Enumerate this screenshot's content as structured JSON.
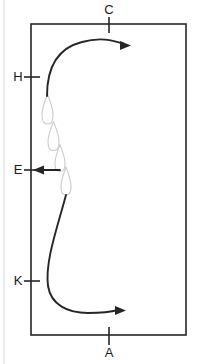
{
  "figure": {
    "title": "",
    "background_color": "#ffffff",
    "stroke_color": "#262626",
    "droplet_color": "#cccccc",
    "margin_rule_color": "#d8d8d8",
    "width": 197,
    "height": 364
  },
  "frame": {
    "name": "rectangle-border",
    "left": 31,
    "top": 24,
    "right": 186,
    "bottom": 335,
    "stroke_width": 1.6
  },
  "labels": {
    "top": {
      "text": "C",
      "x": 109,
      "y": 14,
      "tick_axis": "vertical"
    },
    "bottom": {
      "text": "A",
      "x": 109,
      "y": 357,
      "tick_axis": "vertical"
    },
    "left_upper": {
      "text": "H",
      "x": 18,
      "y": 81,
      "tick_axis": "horizontal"
    },
    "left_middle": {
      "text": "E",
      "x": 18,
      "y": 174,
      "tick_axis": "horizontal"
    },
    "left_lower": {
      "text": "K",
      "x": 18,
      "y": 285,
      "tick_axis": "horizontal"
    }
  },
  "ticks": [
    {
      "name": "tick-c",
      "x1": 109,
      "y1": 17,
      "x2": 109,
      "y2": 33
    },
    {
      "name": "tick-a",
      "x1": 109,
      "y1": 327,
      "x2": 109,
      "y2": 345
    },
    {
      "name": "tick-h",
      "x1": 24,
      "y1": 77,
      "x2": 40,
      "y2": 77
    },
    {
      "name": "tick-e",
      "x1": 24,
      "y1": 170,
      "x2": 40,
      "y2": 170
    },
    {
      "name": "tick-k",
      "x1": 24,
      "y1": 281,
      "x2": 40,
      "y2": 281
    }
  ],
  "arrows": {
    "upper_curve": {
      "name": "upper-flow-arrow",
      "path": "M47,96 C47,66 58,48 82,42 C100,37 112,40 124,44",
      "head_x": 131,
      "head_y": 45.5,
      "direction": "right"
    },
    "lower_curve": {
      "name": "lower-flow-arrow",
      "path": "M66,195 C56,232 45,262 48,286 C51,305 68,313 88,313 C100,313 111,312 118,310",
      "head_x": 126,
      "head_y": 310.5,
      "direction": "right"
    },
    "side_arrow": {
      "name": "left-pointing-arrow",
      "path": "M60,170 L40,170",
      "head_x": 33,
      "head_y": 170,
      "direction": "left"
    }
  },
  "droplets": [
    {
      "name": "droplet-1",
      "cx": 47.5,
      "cy": 109,
      "w": 11,
      "h": 30,
      "rotation": 0
    },
    {
      "name": "droplet-2",
      "cx": 53.5,
      "cy": 136,
      "w": 11,
      "h": 29,
      "rotation": 0
    },
    {
      "name": "droplet-3",
      "cx": 60.0,
      "cy": 158,
      "w": 10,
      "h": 27,
      "rotation": 0
    },
    {
      "name": "droplet-4",
      "cx": 66.0,
      "cy": 181,
      "w": 10,
      "h": 28,
      "rotation": 0
    }
  ],
  "margin_rule": {
    "name": "page-margin-rule",
    "x": 4,
    "y1": 0,
    "y2": 364
  }
}
